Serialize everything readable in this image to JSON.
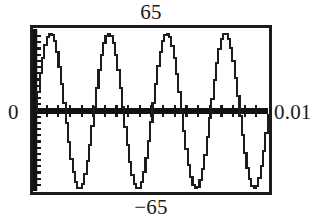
{
  "figure": {
    "kind": "graphing-calculator-plot",
    "background_color": "#ffffff",
    "ink_color": "#1b1b1b"
  },
  "labels": {
    "y_max": "65",
    "y_min": "−65",
    "x_min": "0",
    "x_max": "0.01"
  },
  "chart_data": {
    "type": "line",
    "title": "",
    "subtitle": "",
    "xlabel": "",
    "ylabel": "",
    "xlim": [
      0,
      0.01
    ],
    "ylim": [
      -65,
      65
    ],
    "x_tick_labels": [
      "0",
      "0.01"
    ],
    "y_tick_labels": [
      "-65",
      "65"
    ],
    "grid": false,
    "legend": null,
    "annotations": [],
    "axes_style": {
      "x_axis_drawn_at_y": 0,
      "y_axis_drawn_at_x": 0,
      "x_axis_tick_count": 19,
      "y_axis_tick_count": 25,
      "frame": "box"
    },
    "series": [
      {
        "name": "v(t)",
        "description": "sinusoid, amplitude 65, four complete cycles over 0 to 0.01 s (frequency 400 Hz)",
        "amplitude": 65,
        "cycles": 4,
        "phase": 0,
        "x": [
          0,
          0.000625,
          0.00125,
          0.001875,
          0.0025,
          0.003125,
          0.00375,
          0.004375,
          0.005,
          0.005625,
          0.00625,
          0.006875,
          0.0075,
          0.008125,
          0.00875,
          0.009375,
          0.01
        ],
        "values": [
          0,
          65,
          0,
          -65,
          0,
          65,
          0,
          -65,
          0,
          65,
          0,
          -65,
          0,
          65,
          0,
          -65,
          0
        ]
      }
    ]
  }
}
